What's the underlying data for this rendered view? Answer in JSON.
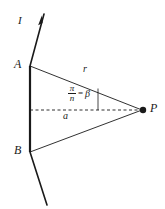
{
  "figure": {
    "background_color": "#ffffff",
    "stroke_color": "#1a1a1a",
    "labels": {
      "current": "I",
      "point_a": "A",
      "point_b": "B",
      "point_p": "P",
      "distance_r": "r",
      "distance_a": "a",
      "angle_numerator": "π",
      "angle_denominator": "n",
      "angle_equals": "=",
      "angle_value": "β"
    },
    "geometry": {
      "point_a": [
        30,
        66
      ],
      "point_b": [
        30,
        152
      ],
      "point_p": [
        143,
        110
      ],
      "wire_top_end": [
        44,
        14
      ],
      "wire_bottom_end": [
        47,
        205
      ],
      "dashed_axis_start": [
        30,
        110
      ],
      "dashed_axis_end": [
        141,
        110
      ],
      "arrow_tip": [
        41,
        22
      ],
      "angle_tick_x": 98,
      "angle_tick_top": 88,
      "angle_tick_bottom": 110,
      "point_p_radius": 3.2,
      "wire_segment_width": 2.2,
      "wire_extension_width": 1.6,
      "ray_width": 0.9,
      "dash_pattern": "3,2.5"
    }
  }
}
